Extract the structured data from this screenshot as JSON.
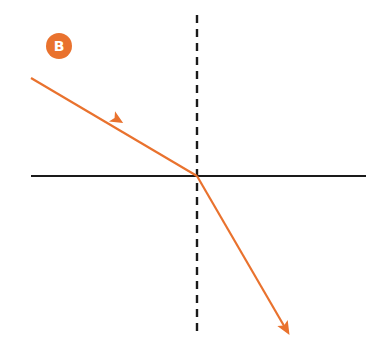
{
  "diagram": {
    "type": "refraction-ray-diagram",
    "badge": {
      "label": "B",
      "color": "#E9722E",
      "text_color": "#ffffff",
      "cx": 59,
      "cy": 46,
      "r": 13
    },
    "colors": {
      "ray": "#E9722E",
      "axis": "#1a1a1a",
      "normal": "#1a1a1a",
      "background": "#ffffff"
    },
    "boundary": {
      "x1": 31,
      "y1": 176,
      "x2": 366,
      "y2": 176
    },
    "normal": {
      "x1": 197,
      "y1": 15,
      "x2": 197,
      "y2": 337,
      "dash": "8 6"
    },
    "incident_ray": {
      "x1": 31,
      "y1": 78,
      "x2": 197,
      "y2": 176,
      "arrow_at": [
        113,
        125
      ]
    },
    "refracted_ray": {
      "x1": 197,
      "y1": 176,
      "x2": 289,
      "y2": 335
    }
  }
}
